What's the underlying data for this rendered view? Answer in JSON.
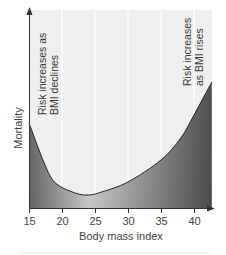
{
  "chart_data": {
    "type": "area",
    "title": "",
    "xlabel": "Body mass index",
    "ylabel": "Mortality",
    "xlim": [
      15,
      42.7
    ],
    "ylim": [
      0,
      100
    ],
    "x_ticks": [
      15,
      20,
      25,
      30,
      35,
      40
    ],
    "x_tick_labels": [
      "15",
      "20",
      "25",
      "30",
      "35",
      "40"
    ],
    "y_ticks": [],
    "grid": {
      "vertical": true,
      "horizontal": false
    },
    "legend": null,
    "series": [
      {
        "name": "Mortality risk (relative)",
        "x": [
          15,
          17.3,
          19,
          22,
          24,
          26,
          30,
          35,
          38,
          40,
          42.7
        ],
        "values": [
          42.5,
          22.5,
          12.5,
          7.5,
          6.5,
          8,
          13,
          24,
          35,
          46.5,
          63
        ]
      }
    ],
    "annotations": [
      {
        "text_lines": [
          "Risk increases as",
          "BMI declines"
        ],
        "position": "upper-left",
        "rotation": -90
      },
      {
        "text_lines": [
          "Risk increases",
          "as BMI rises"
        ],
        "position": "upper-right",
        "rotation": -90
      }
    ]
  },
  "colors": {
    "plot_background": "#efefef",
    "grid": "#ffffff",
    "axis": "#333333",
    "curve": "#222222",
    "fill_dark": "#555555",
    "fill_light": "#e8e8e8",
    "text": "#444444"
  }
}
